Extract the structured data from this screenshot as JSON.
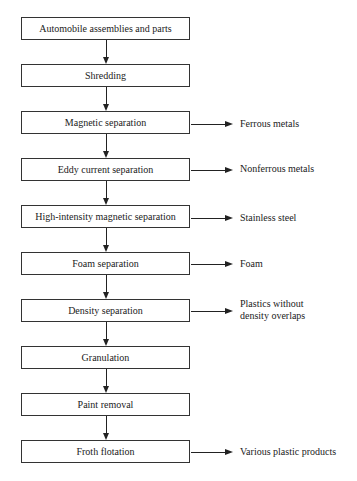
{
  "diagram": {
    "type": "process-flowchart",
    "steps": [
      {
        "label": "Automobile assemblies and parts",
        "output": null
      },
      {
        "label": "Shredding",
        "output": null
      },
      {
        "label": "Magnetic separation",
        "output": "Ferrous metals"
      },
      {
        "label": "Eddy current separation",
        "output": "Nonferrous metals"
      },
      {
        "label": "High-intensity magnetic separation",
        "output": "Stainless steel"
      },
      {
        "label": "Foam separation",
        "output": "Foam"
      },
      {
        "label": "Density separation",
        "output": "Plastics without\ndensity overlaps"
      },
      {
        "label": "Granulation",
        "output": null
      },
      {
        "label": "Paint removal",
        "output": null
      },
      {
        "label": "Froth flotation",
        "output": "Various plastic products"
      }
    ]
  }
}
